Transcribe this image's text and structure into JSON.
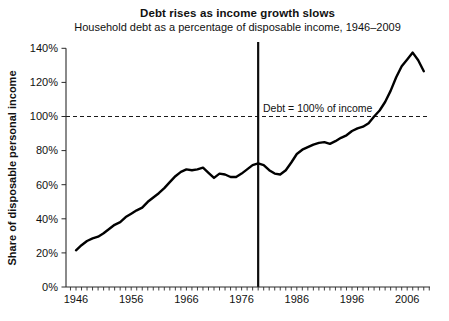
{
  "chart_data": {
    "type": "line",
    "title": "Debt rises as income growth slows",
    "subtitle": "Household debt as a percentage of disposable income, 1946–2009",
    "xlabel": "",
    "ylabel": "Share of disposable personal income",
    "xlim": [
      1944,
      2010
    ],
    "ylim": [
      0,
      140
    ],
    "grid": false,
    "legend": "none",
    "x_tick_labels": [
      "1946",
      "1956",
      "1966",
      "1976",
      "1986",
      "1996",
      "2006"
    ],
    "x_tick_years": [
      1946,
      1956,
      1966,
      1976,
      1986,
      1996,
      2006
    ],
    "minor_x_tick_interval_years": 1,
    "y_tick_labels": [
      "0%",
      "20%",
      "40%",
      "60%",
      "80%",
      "100%",
      "120%",
      "140%"
    ],
    "y_tick_values": [
      0,
      20,
      40,
      60,
      80,
      100,
      120,
      140
    ],
    "annotation": {
      "text": "Debt = 100% of income",
      "attached_to_y": 100
    },
    "reference_lines": {
      "horizontal_dashed": {
        "y": 100,
        "style": "dashed"
      },
      "vertical_solid": {
        "x": 1979,
        "style": "solid"
      }
    },
    "colors": {
      "line": "#000000",
      "axis": "#2a2a2a",
      "text": "#111111",
      "background": "#ffffff"
    },
    "series": [
      {
        "name": "Household debt as % of disposable personal income",
        "x": [
          1946,
          1947,
          1948,
          1949,
          1950,
          1951,
          1952,
          1953,
          1954,
          1955,
          1956,
          1957,
          1958,
          1959,
          1960,
          1961,
          1962,
          1963,
          1964,
          1965,
          1966,
          1967,
          1968,
          1969,
          1970,
          1971,
          1972,
          1973,
          1974,
          1975,
          1976,
          1977,
          1978,
          1979,
          1980,
          1981,
          1982,
          1983,
          1984,
          1985,
          1986,
          1987,
          1988,
          1989,
          1990,
          1991,
          1992,
          1993,
          1994,
          1995,
          1996,
          1997,
          1998,
          1999,
          2000,
          2001,
          2002,
          2003,
          2004,
          2005,
          2006,
          2007,
          2008,
          2009
        ],
        "values": [
          21.5,
          24.5,
          27,
          28.5,
          29.5,
          31.5,
          34,
          36.5,
          38,
          41,
          43,
          45,
          46.5,
          50,
          52.5,
          55,
          58,
          61.5,
          65,
          67.5,
          69,
          68.5,
          69,
          70,
          67,
          64,
          66.5,
          66,
          64.5,
          64.5,
          66.5,
          69,
          71.5,
          72.5,
          71.5,
          68.5,
          66.5,
          66,
          68.5,
          73,
          78,
          80.5,
          82,
          83.5,
          84.5,
          85,
          84,
          85.5,
          87.5,
          89,
          91.5,
          93,
          94,
          96,
          100,
          103.5,
          108.5,
          115,
          123,
          129.5,
          133.5,
          137.5,
          133,
          126.5
        ]
      }
    ]
  }
}
